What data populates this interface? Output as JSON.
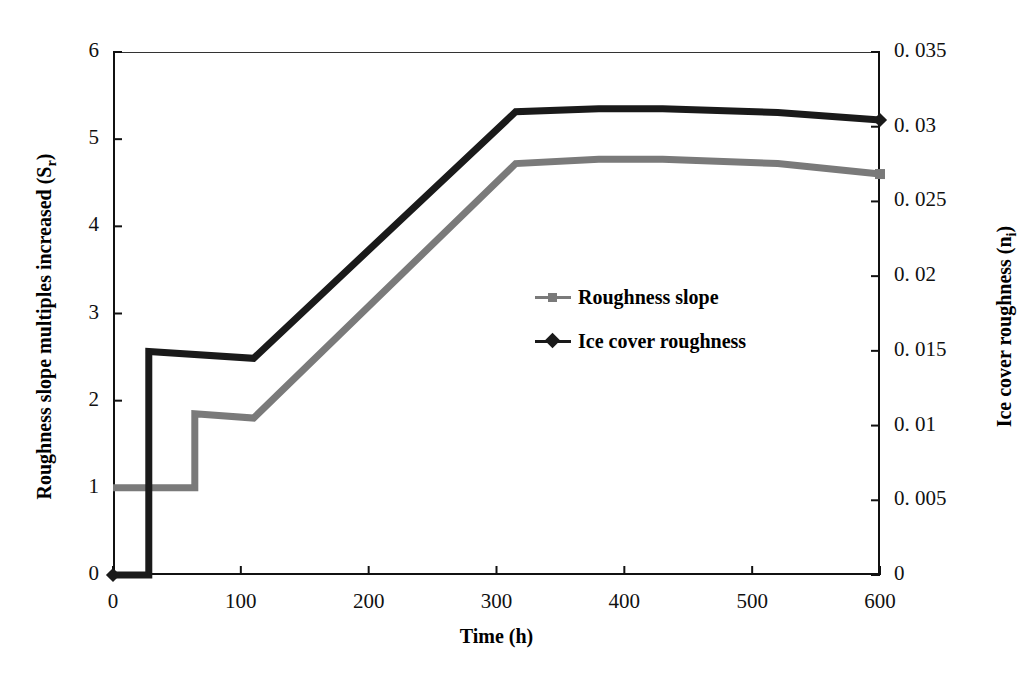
{
  "chart_data": {
    "type": "line",
    "title": "",
    "xlabel": "Time (h)",
    "ylabel": "Roughness slope multiples increased (S",
    "ylabel_sub": "r",
    "ylabel_tail": ")",
    "y2label": "Ice cover roughness (n",
    "y2label_sub": "i",
    "y2label_tail": ")",
    "xlim": [
      0,
      600
    ],
    "ylim": [
      0,
      6
    ],
    "y2lim": [
      0,
      0.035
    ],
    "grid": false,
    "legend_position": "center-right-inside",
    "xticks": [
      "0",
      "100",
      "200",
      "300",
      "400",
      "500",
      "600"
    ],
    "xtick_values": [
      0,
      100,
      200,
      300,
      400,
      500,
      600
    ],
    "yticks_left": [
      "6",
      "5",
      "4",
      "3",
      "2",
      "1",
      "0"
    ],
    "ytick_left_values": [
      6,
      5,
      4,
      3,
      2,
      1,
      0
    ],
    "yticks_right": [
      "0. 035",
      "0. 03",
      "0. 025",
      "0. 02",
      "0. 015",
      "0. 01",
      "0. 005",
      "0"
    ],
    "ytick_right_values": [
      0.035,
      0.03,
      0.025,
      0.02,
      0.015,
      0.01,
      0.005,
      0
    ],
    "series": [
      {
        "name": "Roughness slope",
        "axis": "left",
        "color": "#7a7a7a",
        "marker": "square",
        "line_width": 7,
        "x": [
          0,
          64,
          64,
          110,
          315,
          380,
          430,
          520,
          600
        ],
        "values": [
          1.0,
          1.0,
          1.85,
          1.8,
          4.72,
          4.77,
          4.77,
          4.72,
          4.6
        ]
      },
      {
        "name": "Ice cover roughness",
        "axis": "right",
        "color": "#1a1a1a",
        "marker": "diamond",
        "line_width": 7,
        "x": [
          0,
          28,
          28,
          110,
          315,
          380,
          430,
          520,
          600
        ],
        "values": [
          0.0,
          0.0,
          0.01495,
          0.0145,
          0.031,
          0.0312,
          0.0312,
          0.03095,
          0.03045
        ]
      }
    ]
  },
  "legend": {
    "items": [
      {
        "label": "Roughness slope",
        "color": "#7a7a7a",
        "marker": "square"
      },
      {
        "label": "Ice cover roughness",
        "color": "#1a1a1a",
        "marker": "diamond"
      }
    ]
  }
}
